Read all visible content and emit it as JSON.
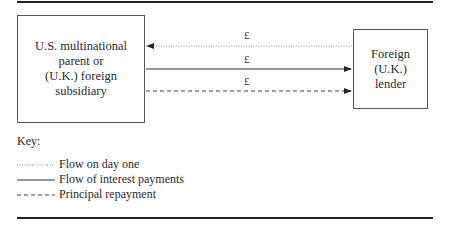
{
  "left_box": {
    "lines": [
      "U.S. multinational",
      "parent or",
      "(U.K.) foreign",
      "subsidiary"
    ]
  },
  "right_box": {
    "lines": [
      "Foreign",
      "(U.K.)",
      "lender"
    ]
  },
  "flows": [
    {
      "label": "£",
      "style": "dotted",
      "direction": "to-left",
      "meaning": "Flow on day one"
    },
    {
      "label": "£",
      "style": "solid",
      "direction": "to-right",
      "meaning": "Flow of interest payments"
    },
    {
      "label": "£",
      "style": "dashed",
      "direction": "to-right",
      "meaning": "Principal repayment"
    }
  ],
  "key": {
    "title": "Key:",
    "items": [
      {
        "style": "dotted",
        "label": "Flow on day one"
      },
      {
        "style": "solid",
        "label": "Flow of interest payments"
      },
      {
        "style": "dashed",
        "label": "Principal repayment"
      }
    ]
  }
}
